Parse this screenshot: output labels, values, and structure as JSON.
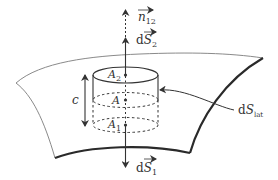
{
  "figure": {
    "type": "gauss-cylinder-interface",
    "colors": {
      "stroke": "#333333",
      "surface_thin": "#7a7a7a",
      "surface_thick": "#2a2a2a"
    },
    "labels": {
      "normal_vector": {
        "base": "n",
        "sub": "12"
      },
      "top_area_vector": {
        "prefix": "d",
        "base": "S",
        "sub": "2"
      },
      "bottom_area_vector": {
        "prefix": "d",
        "base": "S",
        "sub": "1"
      },
      "lateral_area": {
        "prefix": "d",
        "base": "S",
        "sub": "lat"
      },
      "top_face": {
        "base": "A",
        "sub": "2"
      },
      "middle_point": {
        "base": "A"
      },
      "bottom_face": {
        "base": "A",
        "sub": "1"
      },
      "height": "c"
    }
  }
}
